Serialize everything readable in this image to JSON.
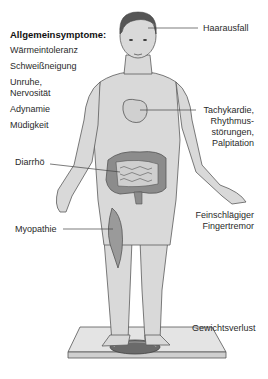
{
  "general_symptoms": {
    "title": "Allgemeinsymptome:",
    "items": [
      "Wärmeintoleranz",
      "Schweißneigung",
      "Unruhe,",
      "Nervosität",
      "Adynamie",
      "Müdigkeit"
    ]
  },
  "labels": {
    "hair": "Haarausfall",
    "heart": [
      "Tachykardie,",
      "Rhythmus-",
      "störungen,",
      "Palpitation"
    ],
    "gut": "Diarrhö",
    "muscle": "Myopathie",
    "tremor": [
      "Feinschlägiger",
      "Fingertremor"
    ],
    "weight": "Gewichtsverlust"
  },
  "colors": {
    "skin": "#d9d9d9",
    "outline": "#5a5a5a",
    "hair": "#555555",
    "organ": "#8c8c8c",
    "leader_line": "#444444"
  }
}
